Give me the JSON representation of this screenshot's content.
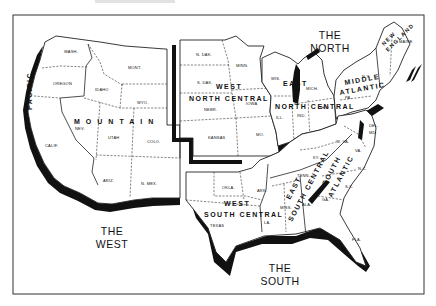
{
  "header": {
    "faint_title": "(illegible faded caption)"
  },
  "map": {
    "title": "United States Census Regions and Divisions",
    "regions": [
      {
        "name_line1": "THE",
        "name_line2": "WEST"
      },
      {
        "name_line1": "THE",
        "name_line2": "NORTH"
      },
      {
        "name_line1": "THE",
        "name_line2": "SOUTH"
      }
    ],
    "divisions": {
      "pacific": "PACIFIC",
      "mountain": "MOUNTAIN",
      "west_north_central_1": "WEST",
      "west_north_central_2": "NORTH CENTRAL",
      "east_north_central_1": "EAST",
      "east_north_central_2": "NORTH CENTRAL",
      "middle_atlantic_1": "MIDDLE",
      "middle_atlantic_2": "ATLANTIC",
      "new_england_1": "NEW",
      "new_england_2": "ENGLAND",
      "west_south_central_1": "WEST",
      "west_south_central_2": "SOUTH CENTRAL",
      "east_south_central_1": "EAST",
      "east_south_central_2": "SOUTH CENTRAL",
      "south_atlantic_1": "SOUTH",
      "south_atlantic_2": "ATLANTIC"
    },
    "states": {
      "wash": "WASH.",
      "oregon": "OREGON",
      "calif": "CALIF.",
      "idaho": "IDAHO",
      "mont": "MONT.",
      "wyo": "WYO.",
      "nev": "NEV.",
      "utah": "UTAH",
      "colo": "COLO.",
      "ariz": "ARIZ.",
      "nmex": "N. MEX.",
      "ndak": "N. DAK.",
      "sdak": "S. DAK.",
      "nebr": "NEBR.",
      "kansas": "KANSAS",
      "minn": "MINN.",
      "iowa": "IOWA",
      "mo": "MO.",
      "wis": "WIS.",
      "mich": "MICH.",
      "ill": "ILL.",
      "ind": "IND.",
      "ohio": "OHIO",
      "ny": "N.Y.",
      "pa": "PA.",
      "maine": "MAINE",
      "okla": "OKLA.",
      "ark": "ARK.",
      "texas": "TEXAS",
      "la": "LA.",
      "ky": "KY.",
      "tenn": "TENN.",
      "miss": "MISS.",
      "ala": "ALA.",
      "wva": "W. VA.",
      "va": "VA.",
      "nc": "N.C.",
      "sc": "S.C.",
      "ga": "GA.",
      "fla": "FLA.",
      "del": "DEL.",
      "md": "MD."
    },
    "colors": {
      "ink": "#111111",
      "paper": "#ffffff",
      "frame": "#333333"
    }
  }
}
